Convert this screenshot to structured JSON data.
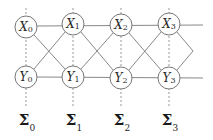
{
  "diagram": {
    "type": "lattice-graph",
    "colors": {
      "edge": "#888888",
      "node_stroke": "#777777",
      "dashed": "#999999",
      "text": "#2a2a2a"
    },
    "top_row": [
      {
        "symbol": "X",
        "index": "0"
      },
      {
        "symbol": "X",
        "index": "1"
      },
      {
        "symbol": "X",
        "index": "2"
      },
      {
        "symbol": "X",
        "index": "3"
      }
    ],
    "bottom_row": [
      {
        "symbol": "Y",
        "index": "0"
      },
      {
        "symbol": "Y",
        "index": "1"
      },
      {
        "symbol": "Y",
        "index": "2"
      },
      {
        "symbol": "Y",
        "index": "3"
      }
    ],
    "sigma_labels": [
      {
        "symbol": "Σ",
        "index": "0"
      },
      {
        "symbol": "Σ",
        "index": "1"
      },
      {
        "symbol": "Σ",
        "index": "2"
      },
      {
        "symbol": "Σ",
        "index": "3"
      }
    ]
  }
}
